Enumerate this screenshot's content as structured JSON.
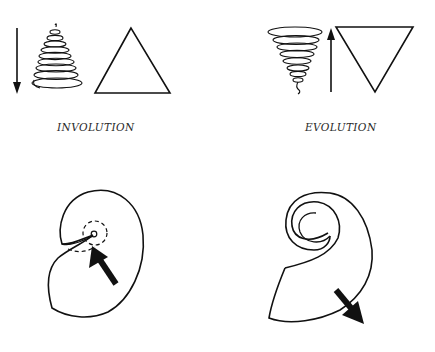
{
  "figure": {
    "panels": [
      {
        "id": "involution",
        "label": "INVOLUTION",
        "arrow_direction": "down",
        "spiral_shape": "upright-cone",
        "triangle": "upright"
      },
      {
        "id": "evolution",
        "label": "EVOLUTION",
        "arrow_direction": "up",
        "spiral_shape": "inverted-cone",
        "triangle": "inverted"
      }
    ],
    "shells": [
      {
        "id": "involution-shell",
        "arrow_direction": "inward",
        "center_marker": "dashed-circle"
      },
      {
        "id": "evolution-shell",
        "arrow_direction": "outward",
        "center_marker": "open-spiral"
      }
    ],
    "colors": {
      "background": "#ffffff",
      "ink": "#111111"
    }
  }
}
